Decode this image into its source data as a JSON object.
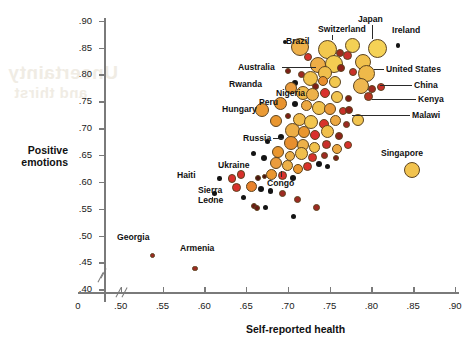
{
  "watermark": {
    "line1": "Uncertainty",
    "line2": "and thirst"
  },
  "axes": {
    "y_title_line1": "Positive",
    "y_title_line2": "emotions",
    "x_title": "Self-reported health",
    "y_ticks": [
      ".90",
      ".85",
      ".80",
      ".75",
      ".70",
      ".65",
      ".60",
      ".55",
      ".50",
      ".45",
      ".40"
    ],
    "y_values": [
      0.9,
      0.85,
      0.8,
      0.75,
      0.7,
      0.65,
      0.6,
      0.55,
      0.5,
      0.45,
      0.4
    ],
    "x_ticks": [
      "0",
      ".50",
      ".55",
      ".60",
      ".65",
      ".70",
      ".75",
      ".80",
      ".85",
      ".90"
    ],
    "x_values": [
      null,
      0.5,
      0.55,
      0.6,
      0.65,
      0.7,
      0.75,
      0.8,
      0.85,
      0.9
    ],
    "origin_label": "0"
  },
  "chart_data": {
    "type": "scatter",
    "title": "",
    "xlabel": "Self-reported health",
    "ylabel": "Positive emotions",
    "xlim": [
      0.48,
      0.9
    ],
    "ylim": [
      0.395,
      0.905
    ],
    "grid": false,
    "legend": "none",
    "axis_break": true,
    "note": "Bubble area encodes an unlabeled third variable; color ramps pale-yellow to dark-maroon.",
    "labeled_points": [
      {
        "name": "Brazil",
        "x": 0.712,
        "y": 0.848,
        "r": 9.0,
        "color": "#eeb04a",
        "label_x": 286,
        "label_y": 36,
        "leader": "v"
      },
      {
        "name": "Switzerland",
        "x": 0.746,
        "y": 0.846,
        "r": 9.5,
        "color": "#f2c84e",
        "label_x": 318,
        "label_y": 24,
        "leader": "v"
      },
      {
        "name": "Japan",
        "x": 0.776,
        "y": 0.852,
        "r": 7.5,
        "color": "#f3d055",
        "label_x": 358,
        "label_y": 14,
        "leader": "v"
      },
      {
        "name": "Ireland",
        "x": 0.806,
        "y": 0.848,
        "r": 9.5,
        "color": "#f5d256",
        "label_x": 392,
        "label_y": 25,
        "leader": "none"
      },
      {
        "name": "Australia",
        "x": 0.742,
        "y": 0.802,
        "r": 7.0,
        "color": "#f0bf4c",
        "label_x": 238,
        "label_y": 62,
        "leader": "h"
      },
      {
        "name": "United States",
        "x": 0.793,
        "y": 0.8,
        "r": 8.5,
        "color": "#efb94a",
        "label_x": 386,
        "label_y": 64,
        "leader": "h"
      },
      {
        "name": "Rwanda",
        "x": 0.654,
        "y": 0.795,
        "r": 2.0,
        "color": "#141414",
        "label_x": 229,
        "label_y": 79,
        "leader": "none"
      },
      {
        "name": "China",
        "x": 0.806,
        "y": 0.772,
        "r": 4.0,
        "color": "#9e2a22",
        "label_x": 414,
        "label_y": 80,
        "leader": "h"
      },
      {
        "name": "Nigeria",
        "x": 0.703,
        "y": 0.773,
        "r": 6.0,
        "color": "#ea9c3e",
        "label_x": 276,
        "label_y": 88,
        "leader": "h"
      },
      {
        "name": "Kenya",
        "x": 0.795,
        "y": 0.757,
        "r": 4.5,
        "color": "#b8321f",
        "label_x": 418,
        "label_y": 94,
        "leader": "h"
      },
      {
        "name": "Peru",
        "x": 0.69,
        "y": 0.745,
        "r": 6.5,
        "color": "#e8932f",
        "label_x": 259,
        "label_y": 97,
        "leader": "h"
      },
      {
        "name": "Hungary",
        "x": 0.668,
        "y": 0.733,
        "r": 7.0,
        "color": "#ea9a35",
        "label_x": 222,
        "label_y": 104,
        "leader": "none"
      },
      {
        "name": "Malawi",
        "x": 0.772,
        "y": 0.733,
        "r": 4.0,
        "color": "#8e2118",
        "label_x": 412,
        "label_y": 110,
        "leader": "h"
      },
      {
        "name": "Russia",
        "x": 0.703,
        "y": 0.672,
        "r": 7.0,
        "color": "#e88f2e",
        "label_x": 243,
        "label_y": 133,
        "leader": "h"
      },
      {
        "name": "Singapore",
        "x": 0.848,
        "y": 0.622,
        "r": 8.0,
        "color": "#f2c34f",
        "label_x": 381,
        "label_y": 148,
        "leader": "none"
      },
      {
        "name": "Ukraine",
        "x": 0.643,
        "y": 0.613,
        "r": 4.2,
        "color": "#d8312c",
        "label_x": 218,
        "label_y": 160,
        "leader": "none"
      },
      {
        "name": "Haiti",
        "x": 0.617,
        "y": 0.605,
        "r": 2.2,
        "color": "#141414",
        "label_x": 177,
        "label_y": 170,
        "leader": "none"
      },
      {
        "name": "Congo",
        "x": 0.722,
        "y": 0.628,
        "r": 4.5,
        "color": "#d8312c",
        "label_x": 267,
        "label_y": 178,
        "leader": "v"
      },
      {
        "name": "Sierra Leone",
        "x": 0.637,
        "y": 0.588,
        "r": 4.5,
        "color": "#d8312c",
        "label_x": 198,
        "label_y": 186,
        "leader": "v"
      },
      {
        "name": "Georgia",
        "x": 0.537,
        "y": 0.462,
        "r": 2.8,
        "color": "#9e2a22",
        "label_x": 117,
        "label_y": 232,
        "leader": "none"
      },
      {
        "name": "Armenia",
        "x": 0.588,
        "y": 0.438,
        "r": 2.8,
        "color": "#9e2a22",
        "label_x": 180,
        "label_y": 243,
        "leader": "none"
      }
    ],
    "points": [
      {
        "x": 0.714,
        "y": 0.851,
        "r": 9.0,
        "color": "#eeb04a"
      },
      {
        "x": 0.747,
        "y": 0.847,
        "r": 9.5,
        "color": "#f2c84e"
      },
      {
        "x": 0.777,
        "y": 0.853,
        "r": 7.5,
        "color": "#f3d055"
      },
      {
        "x": 0.807,
        "y": 0.849,
        "r": 9.5,
        "color": "#f5d256"
      },
      {
        "x": 0.697,
        "y": 0.861,
        "r": 2.0,
        "color": "#141414"
      },
      {
        "x": 0.832,
        "y": 0.854,
        "r": 2.2,
        "color": "#141414"
      },
      {
        "x": 0.724,
        "y": 0.833,
        "r": 4.0,
        "color": "#d8312c"
      },
      {
        "x": 0.762,
        "y": 0.84,
        "r": 4.0,
        "color": "#a02a1e"
      },
      {
        "x": 0.771,
        "y": 0.836,
        "r": 4.5,
        "color": "#c9302a"
      },
      {
        "x": 0.79,
        "y": 0.824,
        "r": 8.0,
        "color": "#f1c14d"
      },
      {
        "x": 0.755,
        "y": 0.82,
        "r": 9.0,
        "color": "#f3cd52"
      },
      {
        "x": 0.736,
        "y": 0.818,
        "r": 8.0,
        "color": "#edad46"
      },
      {
        "x": 0.745,
        "y": 0.803,
        "r": 7.0,
        "color": "#f0bf4c"
      },
      {
        "x": 0.763,
        "y": 0.812,
        "r": 4.0,
        "color": "#8e2118"
      },
      {
        "x": 0.778,
        "y": 0.805,
        "r": 4.2,
        "color": "#c9302a"
      },
      {
        "x": 0.794,
        "y": 0.801,
        "r": 8.5,
        "color": "#efb94a"
      },
      {
        "x": 0.716,
        "y": 0.8,
        "r": 3.5,
        "color": "#9e2a22"
      },
      {
        "x": 0.7,
        "y": 0.806,
        "r": 3.0,
        "color": "#7d1d16"
      },
      {
        "x": 0.727,
        "y": 0.793,
        "r": 7.5,
        "color": "#f0c24d"
      },
      {
        "x": 0.742,
        "y": 0.788,
        "r": 5.0,
        "color": "#e98f2e"
      },
      {
        "x": 0.756,
        "y": 0.786,
        "r": 6.0,
        "color": "#f2c84e"
      },
      {
        "x": 0.733,
        "y": 0.778,
        "r": 3.5,
        "color": "#7d1d16"
      },
      {
        "x": 0.708,
        "y": 0.784,
        "r": 3.0,
        "color": "#141414"
      },
      {
        "x": 0.788,
        "y": 0.778,
        "r": 8.0,
        "color": "#eeb750"
      },
      {
        "x": 0.801,
        "y": 0.773,
        "r": 4.0,
        "color": "#9e2a22"
      },
      {
        "x": 0.812,
        "y": 0.776,
        "r": 4.0,
        "color": "#c9302a"
      },
      {
        "x": 0.704,
        "y": 0.774,
        "r": 6.0,
        "color": "#ea9c3e"
      },
      {
        "x": 0.718,
        "y": 0.766,
        "r": 7.0,
        "color": "#f0bb4b"
      },
      {
        "x": 0.73,
        "y": 0.762,
        "r": 6.5,
        "color": "#edb149"
      },
      {
        "x": 0.745,
        "y": 0.765,
        "r": 5.0,
        "color": "#d8312c"
      },
      {
        "x": 0.759,
        "y": 0.758,
        "r": 6.0,
        "color": "#f1c44f"
      },
      {
        "x": 0.773,
        "y": 0.755,
        "r": 3.5,
        "color": "#7d1d16"
      },
      {
        "x": 0.796,
        "y": 0.758,
        "r": 4.5,
        "color": "#b8321f"
      },
      {
        "x": 0.691,
        "y": 0.746,
        "r": 6.5,
        "color": "#e8932f"
      },
      {
        "x": 0.709,
        "y": 0.744,
        "r": 3.0,
        "color": "#141414"
      },
      {
        "x": 0.722,
        "y": 0.742,
        "r": 5.5,
        "color": "#eca842"
      },
      {
        "x": 0.737,
        "y": 0.738,
        "r": 7.0,
        "color": "#f1c24d"
      },
      {
        "x": 0.751,
        "y": 0.735,
        "r": 6.0,
        "color": "#e99a38"
      },
      {
        "x": 0.766,
        "y": 0.731,
        "r": 4.0,
        "color": "#c9302a"
      },
      {
        "x": 0.773,
        "y": 0.734,
        "r": 4.0,
        "color": "#8e2118"
      },
      {
        "x": 0.669,
        "y": 0.734,
        "r": 7.0,
        "color": "#ea9a35"
      },
      {
        "x": 0.686,
        "y": 0.714,
        "r": 6.0,
        "color": "#e9962f"
      },
      {
        "x": 0.7,
        "y": 0.722,
        "r": 3.0,
        "color": "#7d1d16"
      },
      {
        "x": 0.714,
        "y": 0.716,
        "r": 6.5,
        "color": "#f0bb4b"
      },
      {
        "x": 0.728,
        "y": 0.712,
        "r": 7.0,
        "color": "#f2c64f"
      },
      {
        "x": 0.743,
        "y": 0.708,
        "r": 5.0,
        "color": "#d8312c"
      },
      {
        "x": 0.757,
        "y": 0.714,
        "r": 5.5,
        "color": "#eca842"
      },
      {
        "x": 0.77,
        "y": 0.706,
        "r": 3.5,
        "color": "#9e2a22"
      },
      {
        "x": 0.784,
        "y": 0.716,
        "r": 6.0,
        "color": "#f1c44f"
      },
      {
        "x": 0.705,
        "y": 0.696,
        "r": 7.5,
        "color": "#edae47"
      },
      {
        "x": 0.719,
        "y": 0.692,
        "r": 6.0,
        "color": "#e9962f"
      },
      {
        "x": 0.733,
        "y": 0.688,
        "r": 5.0,
        "color": "#d8312c"
      },
      {
        "x": 0.747,
        "y": 0.694,
        "r": 6.5,
        "color": "#f0bf4c"
      },
      {
        "x": 0.761,
        "y": 0.686,
        "r": 4.0,
        "color": "#8e2118"
      },
      {
        "x": 0.692,
        "y": 0.684,
        "r": 3.0,
        "color": "#141414"
      },
      {
        "x": 0.676,
        "y": 0.676,
        "r": 2.5,
        "color": "#141414"
      },
      {
        "x": 0.704,
        "y": 0.673,
        "r": 7.0,
        "color": "#e88f2e"
      },
      {
        "x": 0.718,
        "y": 0.668,
        "r": 6.0,
        "color": "#edb149"
      },
      {
        "x": 0.732,
        "y": 0.664,
        "r": 5.5,
        "color": "#f1c24d"
      },
      {
        "x": 0.746,
        "y": 0.67,
        "r": 4.5,
        "color": "#c9302a"
      },
      {
        "x": 0.759,
        "y": 0.662,
        "r": 5.0,
        "color": "#eca842"
      },
      {
        "x": 0.772,
        "y": 0.668,
        "r": 4.0,
        "color": "#d8312c"
      },
      {
        "x": 0.688,
        "y": 0.656,
        "r": 6.0,
        "color": "#e9962f"
      },
      {
        "x": 0.702,
        "y": 0.648,
        "r": 5.0,
        "color": "#edb149"
      },
      {
        "x": 0.716,
        "y": 0.652,
        "r": 6.5,
        "color": "#f0bf4c"
      },
      {
        "x": 0.73,
        "y": 0.646,
        "r": 4.5,
        "color": "#d8312c"
      },
      {
        "x": 0.744,
        "y": 0.65,
        "r": 3.5,
        "color": "#9e2a22"
      },
      {
        "x": 0.758,
        "y": 0.644,
        "r": 3.0,
        "color": "#7d1d16"
      },
      {
        "x": 0.672,
        "y": 0.644,
        "r": 3.0,
        "color": "#141414"
      },
      {
        "x": 0.659,
        "y": 0.652,
        "r": 2.5,
        "color": "#141414"
      },
      {
        "x": 0.686,
        "y": 0.636,
        "r": 6.0,
        "color": "#ea9c3e"
      },
      {
        "x": 0.7,
        "y": 0.63,
        "r": 5.5,
        "color": "#edb149"
      },
      {
        "x": 0.723,
        "y": 0.629,
        "r": 4.5,
        "color": "#d8312c"
      },
      {
        "x": 0.712,
        "y": 0.624,
        "r": 5.0,
        "color": "#e9962f"
      },
      {
        "x": 0.737,
        "y": 0.634,
        "r": 3.0,
        "color": "#141414"
      },
      {
        "x": 0.748,
        "y": 0.628,
        "r": 2.5,
        "color": "#141414"
      },
      {
        "x": 0.849,
        "y": 0.623,
        "r": 8.0,
        "color": "#f2c34f"
      },
      {
        "x": 0.644,
        "y": 0.614,
        "r": 4.2,
        "color": "#d8312c"
      },
      {
        "x": 0.633,
        "y": 0.606,
        "r": 4.2,
        "color": "#d8312c"
      },
      {
        "x": 0.618,
        "y": 0.606,
        "r": 2.2,
        "color": "#141414"
      },
      {
        "x": 0.664,
        "y": 0.607,
        "r": 3.0,
        "color": "#4a1510"
      },
      {
        "x": 0.672,
        "y": 0.61,
        "r": 2.8,
        "color": "#4a1510"
      },
      {
        "x": 0.681,
        "y": 0.614,
        "r": 5.5,
        "color": "#e9962f"
      },
      {
        "x": 0.694,
        "y": 0.612,
        "r": 4.5,
        "color": "#d8312c"
      },
      {
        "x": 0.706,
        "y": 0.608,
        "r": 3.0,
        "color": "#141414"
      },
      {
        "x": 0.638,
        "y": 0.589,
        "r": 4.5,
        "color": "#d8312c"
      },
      {
        "x": 0.612,
        "y": 0.578,
        "r": 2.5,
        "color": "#141414"
      },
      {
        "x": 0.656,
        "y": 0.592,
        "r": 5.5,
        "color": "#e8822a"
      },
      {
        "x": 0.668,
        "y": 0.586,
        "r": 3.0,
        "color": "#141414"
      },
      {
        "x": 0.679,
        "y": 0.583,
        "r": 2.8,
        "color": "#141414"
      },
      {
        "x": 0.647,
        "y": 0.57,
        "r": 2.5,
        "color": "#141414"
      },
      {
        "x": 0.693,
        "y": 0.578,
        "r": 3.5,
        "color": "#9e2a22"
      },
      {
        "x": 0.659,
        "y": 0.556,
        "r": 3.0,
        "color": "#6b1a13"
      },
      {
        "x": 0.663,
        "y": 0.551,
        "r": 3.0,
        "color": "#6b1a13"
      },
      {
        "x": 0.673,
        "y": 0.552,
        "r": 2.5,
        "color": "#141414"
      },
      {
        "x": 0.712,
        "y": 0.568,
        "r": 3.5,
        "color": "#9e2a22"
      },
      {
        "x": 0.734,
        "y": 0.552,
        "r": 3.5,
        "color": "#9e2a22"
      },
      {
        "x": 0.707,
        "y": 0.536,
        "r": 2.5,
        "color": "#141414"
      },
      {
        "x": 0.538,
        "y": 0.463,
        "r": 2.8,
        "color": "#9e2a22"
      },
      {
        "x": 0.589,
        "y": 0.439,
        "r": 2.8,
        "color": "#9e2a22"
      }
    ]
  }
}
